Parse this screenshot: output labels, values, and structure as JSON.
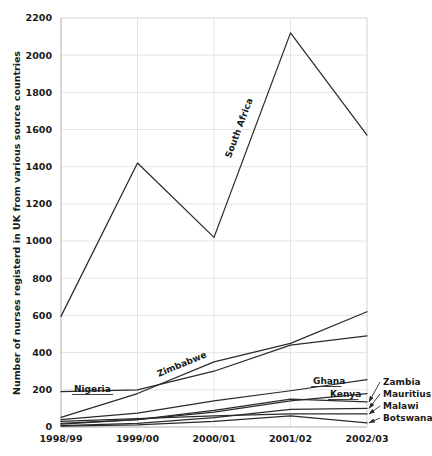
{
  "chart_data": {
    "type": "line",
    "title": "",
    "xlabel": "",
    "ylabel": "Number of nurses registerd in UK from various source countries",
    "categories": [
      "1998/99",
      "1999/00",
      "2000/01",
      "2001/02",
      "2002/03"
    ],
    "ylim": [
      0,
      2200
    ],
    "ytick_step": 200,
    "yticks": [
      "0",
      "200",
      "400",
      "600",
      "800",
      "1000",
      "1200",
      "1400",
      "1600",
      "1800",
      "2000",
      "2200"
    ],
    "grid": true,
    "legend_position": "inline-and-right-callouts",
    "line_color": "#2b2b2b",
    "grid_color": "#d8d8d8",
    "series": [
      {
        "name": "South Africa",
        "label_style": "inline-rotated",
        "values": [
          595,
          1420,
          1020,
          2120,
          1570
        ]
      },
      {
        "name": "Zimbabwe",
        "label_style": "inline-rotated",
        "values": [
          52,
          180,
          350,
          450,
          620
        ]
      },
      {
        "name": "Nigeria",
        "label_style": "inline-underlined",
        "values": [
          190,
          200,
          300,
          440,
          490
        ]
      },
      {
        "name": "Ghana",
        "label_style": "inline-underlined",
        "values": [
          40,
          75,
          140,
          195,
          255
        ]
      },
      {
        "name": "Kenya",
        "label_style": "inline-underlined",
        "values": [
          20,
          40,
          80,
          140,
          180
        ]
      },
      {
        "name": "Zambia",
        "label_style": "right-callout",
        "values": [
          15,
          40,
          90,
          150,
          135
        ]
      },
      {
        "name": "Mauritius",
        "label_style": "right-callout",
        "values": [
          8,
          20,
          50,
          95,
          100
        ]
      },
      {
        "name": "Malawi",
        "label_style": "right-callout",
        "values": [
          30,
          45,
          60,
          70,
          70
        ]
      },
      {
        "name": "Botswana",
        "label_style": "right-callout",
        "values": [
          5,
          12,
          30,
          60,
          22
        ]
      }
    ]
  }
}
